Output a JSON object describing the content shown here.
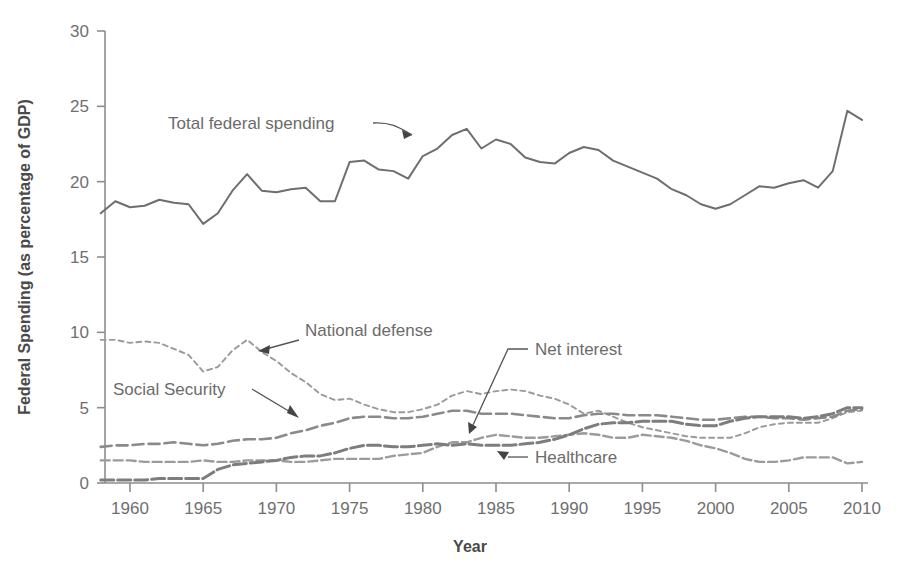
{
  "chart_data": {
    "type": "line",
    "title": "",
    "xlabel": "Year",
    "ylabel": "Federal Spending (as percentage of GDP)",
    "xlim": [
      1958,
      2010
    ],
    "ylim": [
      0,
      30
    ],
    "yticks": [
      0,
      5,
      10,
      15,
      20,
      25,
      30
    ],
    "xticks": [
      1960,
      1965,
      1970,
      1975,
      1980,
      1985,
      1990,
      1995,
      2000,
      2005,
      2010
    ],
    "grid": false,
    "legend_position": "inline-annotations",
    "x": [
      1958,
      1959,
      1960,
      1961,
      1962,
      1963,
      1964,
      1965,
      1966,
      1967,
      1968,
      1969,
      1970,
      1971,
      1972,
      1973,
      1974,
      1975,
      1976,
      1977,
      1978,
      1979,
      1980,
      1981,
      1982,
      1983,
      1984,
      1985,
      1986,
      1987,
      1988,
      1989,
      1990,
      1991,
      1992,
      1993,
      1994,
      1995,
      1996,
      1997,
      1998,
      1999,
      2000,
      2001,
      2002,
      2003,
      2004,
      2005,
      2006,
      2007,
      2008,
      2009,
      2010
    ],
    "series": [
      {
        "name": "Total federal spending",
        "style": "solid",
        "color": "#6e6e6e",
        "values": [
          17.9,
          18.7,
          18.3,
          18.4,
          18.8,
          18.6,
          18.5,
          17.2,
          17.9,
          19.4,
          20.5,
          19.4,
          19.3,
          19.5,
          19.6,
          18.7,
          18.7,
          21.3,
          21.4,
          20.8,
          20.7,
          20.2,
          21.7,
          22.2,
          23.1,
          23.5,
          22.2,
          22.8,
          22.5,
          21.6,
          21.3,
          21.2,
          21.9,
          22.3,
          22.1,
          21.4,
          21.0,
          20.6,
          20.2,
          19.5,
          19.1,
          18.5,
          18.2,
          18.5,
          19.1,
          19.7,
          19.6,
          19.9,
          20.1,
          19.6,
          20.7,
          24.7,
          24.1
        ]
      },
      {
        "name": "National defense",
        "style": "dotted",
        "color": "#9a9a9a",
        "values": [
          9.5,
          9.5,
          9.3,
          9.4,
          9.3,
          8.9,
          8.5,
          7.4,
          7.7,
          8.8,
          9.5,
          8.7,
          8.1,
          7.3,
          6.7,
          5.9,
          5.5,
          5.6,
          5.2,
          4.9,
          4.7,
          4.7,
          4.9,
          5.2,
          5.8,
          6.1,
          5.9,
          6.1,
          6.2,
          6.1,
          5.8,
          5.6,
          5.2,
          4.6,
          4.8,
          4.4,
          4.0,
          3.7,
          3.5,
          3.3,
          3.1,
          3.0,
          3.0,
          3.0,
          3.3,
          3.7,
          3.9,
          4.0,
          4.0,
          4.0,
          4.3,
          4.7,
          4.8
        ]
      },
      {
        "name": "Social Security",
        "style": "dashed",
        "color": "#8a8a8a",
        "values": [
          2.4,
          2.5,
          2.5,
          2.6,
          2.6,
          2.7,
          2.6,
          2.5,
          2.6,
          2.8,
          2.9,
          2.9,
          3.0,
          3.3,
          3.5,
          3.8,
          4.0,
          4.3,
          4.4,
          4.4,
          4.3,
          4.3,
          4.4,
          4.6,
          4.8,
          4.8,
          4.6,
          4.6,
          4.6,
          4.5,
          4.4,
          4.3,
          4.3,
          4.5,
          4.6,
          4.6,
          4.5,
          4.5,
          4.5,
          4.4,
          4.3,
          4.2,
          4.2,
          4.3,
          4.4,
          4.4,
          4.3,
          4.3,
          4.2,
          4.3,
          4.4,
          4.8,
          4.9
        ]
      },
      {
        "name": "Net interest",
        "style": "dashed",
        "color": "#9b9b9b",
        "values": [
          1.5,
          1.5,
          1.5,
          1.4,
          1.4,
          1.4,
          1.4,
          1.5,
          1.4,
          1.4,
          1.5,
          1.5,
          1.5,
          1.4,
          1.4,
          1.5,
          1.6,
          1.6,
          1.6,
          1.6,
          1.8,
          1.9,
          2.0,
          2.4,
          2.7,
          2.7,
          3.0,
          3.2,
          3.1,
          3.0,
          3.0,
          3.1,
          3.2,
          3.3,
          3.2,
          3.0,
          3.0,
          3.2,
          3.1,
          3.0,
          2.8,
          2.5,
          2.3,
          2.0,
          1.6,
          1.4,
          1.4,
          1.5,
          1.7,
          1.7,
          1.7,
          1.3,
          1.4
        ]
      },
      {
        "name": "Healthcare",
        "style": "long-dashed",
        "color": "#7d7d7d",
        "values": [
          0.2,
          0.2,
          0.2,
          0.2,
          0.3,
          0.3,
          0.3,
          0.3,
          0.9,
          1.2,
          1.3,
          1.4,
          1.5,
          1.7,
          1.8,
          1.8,
          2.0,
          2.3,
          2.5,
          2.5,
          2.4,
          2.4,
          2.5,
          2.6,
          2.5,
          2.6,
          2.5,
          2.5,
          2.5,
          2.6,
          2.7,
          2.9,
          3.2,
          3.6,
          3.9,
          4.0,
          4.0,
          4.1,
          4.1,
          4.1,
          3.9,
          3.8,
          3.8,
          4.1,
          4.3,
          4.4,
          4.4,
          4.4,
          4.3,
          4.4,
          4.6,
          5.0,
          5.0
        ]
      }
    ]
  },
  "annotations": [
    {
      "id": "total-federal-spending",
      "label": "Total federal spending"
    },
    {
      "id": "national-defense",
      "label": "National defense"
    },
    {
      "id": "social-security",
      "label": "Social Security"
    },
    {
      "id": "net-interest",
      "label": "Net interest"
    },
    {
      "id": "healthcare",
      "label": "Healthcare"
    }
  ],
  "axes": {
    "y_title": "Federal Spending (as percentage of GDP)",
    "x_title": "Year",
    "y_ticks": [
      "0",
      "5",
      "10",
      "15",
      "20",
      "25",
      "30"
    ],
    "x_ticks": [
      "1960",
      "1965",
      "1970",
      "1975",
      "1980",
      "1985",
      "1990",
      "1995",
      "2000",
      "2005",
      "2010"
    ]
  },
  "colors": {
    "axis": "#8d8d8d",
    "text": "#6f6f6f",
    "total": "#6e6e6e",
    "defense": "#9a9a9a",
    "social": "#8a8a8a",
    "net_interest": "#9b9b9b",
    "healthcare": "#7d7d7d",
    "background": "#ffffff"
  }
}
